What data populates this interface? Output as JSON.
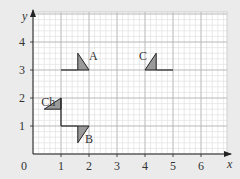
{
  "figure": {
    "type": "coordinate-grid-transformations",
    "background": "#ebebeb",
    "grid_bg": "#ffffff",
    "grid_minor_color": "#dcdcdc",
    "grid_major_color": "#b5b5b5",
    "shape_fill": "#9a9a9a",
    "line_color": "#222222"
  },
  "axes": {
    "x_label": "x",
    "y_label": "y",
    "origin_label": "0",
    "x_ticks": [
      "1",
      "2",
      "3",
      "4",
      "5",
      "6"
    ],
    "y_ticks": [
      "1",
      "2",
      "3",
      "4"
    ],
    "x_range": [
      0,
      7
    ],
    "y_range": [
      0,
      5
    ]
  },
  "shapes": [
    {
      "label": "A",
      "triangle": [
        [
          1.6,
          3
        ],
        [
          2,
          3
        ],
        [
          1.6,
          3.6
        ]
      ],
      "stem": [
        [
          1,
          3
        ],
        [
          1.6,
          3
        ]
      ]
    },
    {
      "label": "C",
      "triangle": [
        [
          4,
          3
        ],
        [
          4.4,
          3
        ],
        [
          4.4,
          3.6
        ]
      ],
      "stem": [
        [
          4.4,
          3
        ],
        [
          5,
          3
        ]
      ]
    },
    {
      "label": "Ch",
      "triangle": [
        [
          0.4,
          1.6
        ],
        [
          1,
          1.6
        ],
        [
          1,
          2
        ]
      ],
      "stem": [
        [
          1,
          1.6
        ],
        [
          1,
          1
        ]
      ]
    },
    {
      "label": "B",
      "triangle": [
        [
          1.6,
          1
        ],
        [
          2,
          1
        ],
        [
          1.6,
          0.4
        ]
      ],
      "stem": [
        [
          1,
          1
        ],
        [
          1.6,
          1
        ]
      ]
    }
  ]
}
